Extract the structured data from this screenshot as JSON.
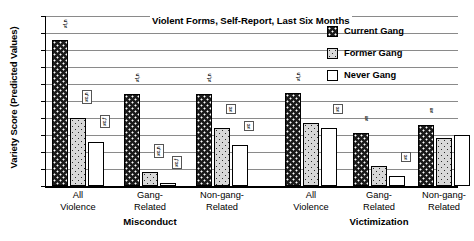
{
  "chart_data": {
    "type": "bar",
    "title": "Violent Forms, Self-Report, Last Six Months",
    "ylabel": "Variety Score (Predicted Values)",
    "xlabel": "",
    "ylim": [
      0.0,
      1.0
    ],
    "ytick_labels": [
      "1.0",
      "0.9",
      "0.8",
      "0.7",
      "0.6",
      "0.5",
      "0.4",
      "0.3",
      "0.2",
      "0.1",
      "0.0"
    ],
    "ytick_values": [
      1.0,
      0.9,
      0.8,
      0.7,
      0.6,
      0.5,
      0.4,
      0.3,
      0.2,
      0.1,
      0.0
    ],
    "grid": true,
    "legend_position": "top-right",
    "legend": [
      "Current Gang",
      "Former Gang",
      "Never Gang"
    ],
    "supergroups": [
      "Misconduct",
      "Victimization"
    ],
    "categories": [
      "All Violence",
      "Gang-Related",
      "Non-gang-Related",
      "All Violence",
      "Gang-Related",
      "Non-gang-Related"
    ],
    "category_lines": [
      [
        "All",
        "Violence"
      ],
      [
        "Gang-",
        "Related"
      ],
      [
        "Non-gang-",
        "Related"
      ],
      [
        "All",
        "Violence"
      ],
      [
        "Gang-",
        "Related"
      ],
      [
        "Non-gang-",
        "Related"
      ]
    ],
    "series": [
      {
        "name": "Current Gang",
        "values": [
          0.86,
          0.54,
          0.54,
          0.55,
          0.31,
          0.36
        ]
      },
      {
        "name": "Former Gang",
        "values": [
          0.4,
          0.08,
          0.34,
          0.37,
          0.115,
          0.28
        ]
      },
      {
        "name": "Never Gang",
        "values": [
          0.26,
          0.015,
          0.24,
          0.34,
          0.06,
          0.3
        ]
      }
    ],
    "annotations": [
      {
        "group": 0,
        "series": "Current Gang",
        "text": "≠f,n",
        "style": "plain"
      },
      {
        "group": 0,
        "series": "Former Gang",
        "text": "≠c,n",
        "style": "boxed"
      },
      {
        "group": 0,
        "series": "Never Gang",
        "text": "≠c,f",
        "style": "boxed"
      },
      {
        "group": 1,
        "series": "Current Gang",
        "text": "≠f,n",
        "style": "plain"
      },
      {
        "group": 1,
        "series": "Former Gang",
        "text": "≠c,n",
        "style": "boxed"
      },
      {
        "group": 1,
        "series": "Never Gang",
        "text": "≠c,f",
        "style": "boxed"
      },
      {
        "group": 2,
        "series": "Current Gang",
        "text": "≠f,n",
        "style": "plain"
      },
      {
        "group": 2,
        "series": "Former Gang",
        "text": "≠c",
        "style": "boxed"
      },
      {
        "group": 2,
        "series": "Never Gang",
        "text": "≠c",
        "style": "boxed"
      },
      {
        "group": 3,
        "series": "Current Gang",
        "text": "≠f,n",
        "style": "plain"
      },
      {
        "group": 3,
        "series": "Never Gang",
        "text": "≠c",
        "style": "boxed"
      },
      {
        "group": 4,
        "series": "Current Gang",
        "text": "≠n",
        "style": "plain"
      },
      {
        "group": 4,
        "series": "Never Gang",
        "text": "≠c",
        "style": "boxed"
      },
      {
        "group": 5,
        "series": "Current Gang",
        "text": "≠n",
        "style": "plain"
      }
    ],
    "colors": {
      "current_gang": "#1b1b1b",
      "former_gang": "#d8d8d8",
      "never_gang": "#ffffff",
      "gridline": "#8a8a8a",
      "axis": "#000000",
      "background": "#ffffff"
    }
  }
}
